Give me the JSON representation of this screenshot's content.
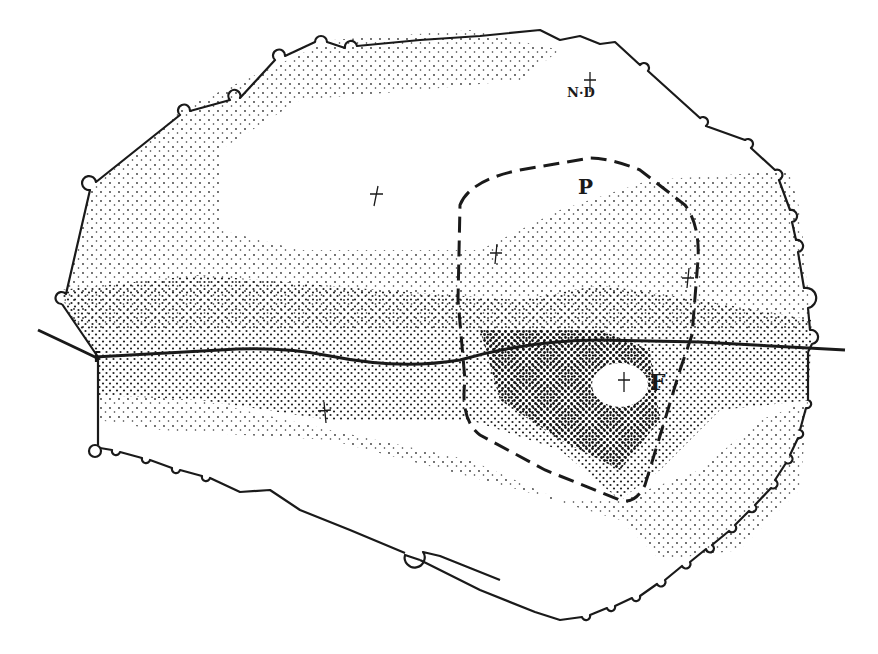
{
  "map": {
    "type": "archaeological site plan with stippled density shading",
    "labels": {
      "nd": "N·D",
      "p": "P",
      "f": "F"
    },
    "markers": [
      {
        "name": "cross-nd",
        "x": 590,
        "y": 80
      },
      {
        "name": "cross-north-center",
        "x": 376,
        "y": 195
      },
      {
        "name": "cross-central",
        "x": 496,
        "y": 254
      },
      {
        "name": "cross-east",
        "x": 688,
        "y": 278
      },
      {
        "name": "cross-f",
        "x": 624,
        "y": 382
      },
      {
        "name": "cross-south-west",
        "x": 324,
        "y": 413
      }
    ],
    "features": {
      "enclosure_outline": "irregular wall with bastion bumps",
      "road": "solid line crossing west to east",
      "dashed_zone": "dashed boundary enclosing area P / F"
    },
    "colors": {
      "ink": "#1a1a1a",
      "paper": "#ffffff"
    }
  }
}
